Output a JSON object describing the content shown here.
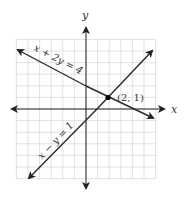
{
  "figure": {
    "x_axis_label": "x",
    "y_axis_label": "y",
    "grid": {
      "xmin": -6,
      "xmax": 6,
      "ymin": -6,
      "ymax": 6,
      "step": 1
    },
    "lines": [
      {
        "id": "line1",
        "equation": "x + 2y = 4",
        "label": "x + 2y = 4"
      },
      {
        "id": "line2",
        "equation": "x − y = 1",
        "label": "x − y = 1"
      }
    ],
    "intersection": {
      "x": 2,
      "y": 1,
      "label": "(2, 1)"
    },
    "colors": {
      "grid": "#d9d9d9",
      "axis": "#222222",
      "line": "#2a2a2a",
      "point": "#000000"
    }
  }
}
